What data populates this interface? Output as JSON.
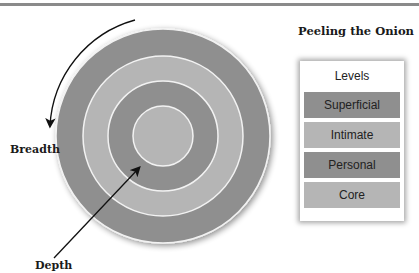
{
  "title": "Peeling the Onion",
  "legend": {
    "header": "Levels",
    "items": [
      {
        "label": "Superficial",
        "color": "#8f8f8f"
      },
      {
        "label": "Intimate",
        "color": "#b5b5b5"
      },
      {
        "label": "Personal",
        "color": "#8f8f8f"
      },
      {
        "label": "Core",
        "color": "#b5b5b5"
      }
    ]
  },
  "axes": {
    "breadth_label": "Breadth",
    "depth_label": "Depth"
  },
  "rings": [
    {
      "name": "Superficial",
      "color": "#8f8f8f"
    },
    {
      "name": "Intimate",
      "color": "#b5b5b5"
    },
    {
      "name": "Personal",
      "color": "#8f8f8f"
    },
    {
      "name": "Core",
      "color": "#b5b5b5"
    }
  ]
}
